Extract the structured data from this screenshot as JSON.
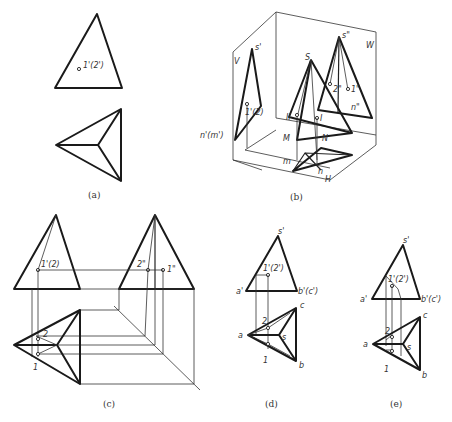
{
  "figure": {
    "panels": [
      {
        "id": "a",
        "caption": "(a)",
        "labels": {
          "point_front": "1'(2')"
        }
      },
      {
        "id": "b",
        "caption": "(b)",
        "labels": {
          "plane_v": "V",
          "plane_w": "W",
          "plane_h": "H",
          "apex_3d": "S",
          "apex_front": "s'",
          "apex_side": "s\"",
          "point_front": "1'(2)",
          "base_front": "n'(m')",
          "point_I": "I",
          "point_II": "II",
          "point_M": "M",
          "point_N": "N",
          "side_2": "2\"",
          "side_1": "1\"",
          "side_n": "n\"",
          "h_m": "m",
          "h_n": "n"
        }
      },
      {
        "id": "c",
        "caption": "(c)",
        "labels": {
          "front_point": "1'(2)",
          "side_2": "2\"",
          "side_1": "1\"",
          "top_2": "2",
          "top_1": "1"
        }
      },
      {
        "id": "d",
        "caption": "(d)",
        "labels": {
          "apex_front": "s'",
          "point_front": "1'(2')",
          "a_front": "a'",
          "bc_front": "b'(c')",
          "top_a": "a",
          "top_b": "b",
          "top_c": "c",
          "top_s": "s",
          "top_1": "1",
          "top_2": "2"
        }
      },
      {
        "id": "e",
        "caption": "(e)",
        "labels": {
          "apex_front": "s'",
          "point_front": "1'(2')",
          "a_front": "a'",
          "bc_front": "b'(c')",
          "top_a": "a",
          "top_b": "b",
          "top_c": "c",
          "top_s": "s",
          "top_1": "1",
          "top_2": "2"
        }
      }
    ]
  }
}
